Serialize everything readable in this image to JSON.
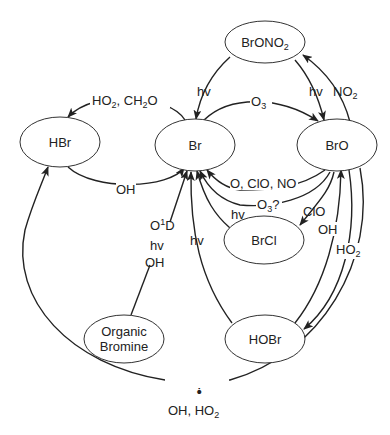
{
  "diagram": {
    "type": "reaction-cycle",
    "nodes": {
      "bronono2": "BrONO2",
      "hbr": "HBr",
      "br": "Br",
      "bro": "BrO",
      "brcl": "BrCl",
      "organic_bromine_line1": "Organic",
      "organic_bromine_line2": "Bromine",
      "hobr": "HOBr"
    },
    "edges": {
      "br_to_hbr": "HO2, CH2O",
      "hbr_to_br": "OH",
      "br_to_bro": "O3",
      "bro_to_br_a": "O, ClO, NO",
      "bro_to_br_b": "O3?",
      "bronono2_to_br": "hv",
      "bronono2_to_bro": "hv",
      "bro_to_bronono2": "NO2",
      "bro_to_brcl": "ClO",
      "brcl_to_br": "hv",
      "hobr_to_br": "hv",
      "hobr_to_bro": "OH",
      "bro_to_hobr": "HO2",
      "organic_to_br_1": "O1D",
      "organic_to_br_2": "hv",
      "organic_to_br_3": "OH",
      "bro_to_hbr": "OH, HO2",
      "bro_to_hbr_question": "?"
    }
  }
}
